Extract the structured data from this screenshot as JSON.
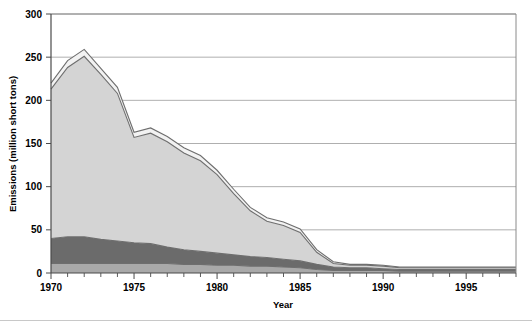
{
  "chart_data": {
    "type": "area",
    "stacked": true,
    "title": "",
    "xlabel": "Year",
    "ylabel": "Emissions (million short tons)",
    "xlim": [
      1970,
      1998
    ],
    "ylim": [
      0,
      300
    ],
    "ytick_labels": [
      "0",
      "50",
      "100",
      "150",
      "200",
      "250",
      "300"
    ],
    "ytick_values": [
      0,
      50,
      100,
      150,
      200,
      250,
      300
    ],
    "xtick_labels": [
      "1970",
      "1975",
      "1980",
      "1985",
      "1990",
      "1995"
    ],
    "xtick_values": [
      1970,
      1975,
      1980,
      1985,
      1990,
      1995
    ],
    "xtick_minor_step": 1,
    "grid": "horizontal",
    "legend": "none",
    "x": [
      1970,
      1971,
      1972,
      1973,
      1974,
      1975,
      1976,
      1977,
      1978,
      1979,
      1980,
      1981,
      1982,
      1983,
      1984,
      1985,
      1986,
      1987,
      1988,
      1989,
      1990,
      1991,
      1992,
      1993,
      1994,
      1995,
      1996,
      1997,
      1998
    ],
    "series": [
      {
        "name": "bottom-band",
        "color": "#a9a9a9",
        "values": [
          11,
          11,
          11,
          11,
          11,
          11,
          11,
          11,
          10,
          10,
          9,
          9,
          8,
          8,
          7,
          6,
          4,
          3,
          3,
          3,
          3,
          2,
          2,
          2,
          2,
          2,
          2,
          2,
          2
        ]
      },
      {
        "name": "middle-band",
        "color": "#6b6b6b",
        "values": [
          29,
          31,
          31,
          28,
          26,
          24,
          23,
          19,
          17,
          15,
          14,
          12,
          11,
          10,
          9,
          8,
          6,
          4,
          3,
          3,
          2,
          2,
          2,
          2,
          2,
          2,
          2,
          2,
          2
        ]
      },
      {
        "name": "top-band",
        "color": "#d4d4d4",
        "values": [
          173,
          196,
          209,
          191,
          171,
          122,
          128,
          122,
          112,
          105,
          91,
          71,
          53,
          42,
          39,
          33,
          14,
          4,
          3,
          3,
          3,
          2,
          2,
          2,
          2,
          2,
          2,
          2,
          2
        ]
      },
      {
        "name": "cap-band",
        "color": "#f2f2f2",
        "values": [
          7,
          8,
          8,
          7,
          7,
          6,
          6,
          6,
          6,
          6,
          5,
          5,
          4,
          4,
          4,
          4,
          3,
          2,
          1,
          1,
          1,
          1,
          1,
          1,
          1,
          1,
          1,
          1,
          1
        ]
      }
    ],
    "totals": [
      220,
      246,
      259,
      237,
      215,
      163,
      168,
      158,
      145,
      136,
      119,
      97,
      76,
      64,
      59,
      51,
      27,
      13,
      10,
      10,
      9,
      7,
      7,
      7,
      7,
      7,
      7,
      7,
      7
    ]
  },
  "colors": {
    "band_bottom": "#a9a9a9",
    "band_middle": "#6b6b6b",
    "band_top": "#d4d4d4",
    "band_cap": "#f2f2f2",
    "outline": "#6e6e6e",
    "grid": "#9a9a9a",
    "axis": "#4a4a4a",
    "frame": "#8a8a8a",
    "background": "#ffffff"
  }
}
